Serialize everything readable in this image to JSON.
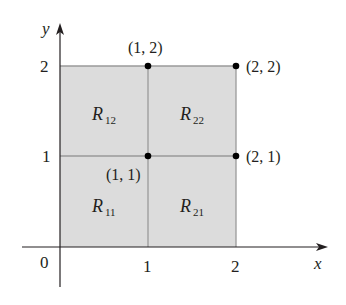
{
  "diagram": {
    "axes": {
      "x_label": "x",
      "y_label": "y",
      "origin_label": "0",
      "x_ticks": [
        "1",
        "2"
      ],
      "y_ticks": [
        "1",
        "2"
      ]
    },
    "subrectangles": [
      {
        "name": "R",
        "sub": "12"
      },
      {
        "name": "R",
        "sub": "22"
      },
      {
        "name": "R",
        "sub": "11"
      },
      {
        "name": "R",
        "sub": "21"
      }
    ],
    "points": [
      {
        "label": "(1, 2)"
      },
      {
        "label": "(2, 2)"
      },
      {
        "label": "(1, 1)"
      },
      {
        "label": "(2, 1)"
      }
    ],
    "colors": {
      "region_fill": "#dcdcdc",
      "grid_line": "#9a9a9a",
      "axis": "#231f20",
      "point": "#000000"
    }
  }
}
